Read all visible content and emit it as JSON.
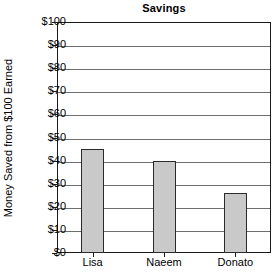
{
  "chart_data": {
    "type": "bar",
    "title": "Savings",
    "xlabel": "",
    "ylabel": "Money Saved from $100 Earned",
    "categories": [
      "Lisa",
      "Naeem",
      "Donato"
    ],
    "values": [
      45,
      40,
      26
    ],
    "ylim": [
      0,
      100
    ],
    "ytick_step": 10,
    "ytick_labels": [
      "$100",
      "$90",
      "$80",
      "$70",
      "$60",
      "$50",
      "$40",
      "$30",
      "$20",
      "$10",
      "$0"
    ],
    "ytick_values": [
      100,
      90,
      80,
      70,
      60,
      50,
      40,
      30,
      20,
      10,
      0
    ],
    "grid": true,
    "legend": false,
    "bar_fill_color": "#c9c9c9",
    "bar_edge_color": "#2b2b2b",
    "grid_color": "#6e6e6e",
    "axis_color": "#1a1a1a",
    "background_color": "#ffffff"
  }
}
